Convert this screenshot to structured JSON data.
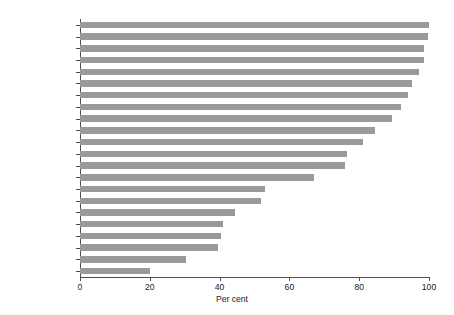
{
  "chart_data": {
    "type": "bar",
    "orientation": "horizontal",
    "title": "",
    "subtitle": "",
    "xlabel": "Per cent",
    "ylabel": "",
    "xlim": [
      0,
      100
    ],
    "xticks": [
      0,
      20,
      40,
      60,
      80,
      100
    ],
    "grid": false,
    "legend": null,
    "bar_color": "#9a9a9a",
    "axis_color": "#4d4d4d",
    "text_color": "#1a1a1a",
    "categories": [
      "Ireland",
      "Sweden",
      "New Zealand",
      "Norway",
      "Finland",
      "Austria",
      "Denmark",
      "Netherlands",
      "Portugal",
      "United States",
      "Luxembourg",
      "Kenya",
      "Poland",
      "UK",
      "Belgium",
      "Germany",
      "France",
      "Brazil",
      "Italy",
      "Canada",
      "Spain",
      "Greece"
    ],
    "values": [
      100,
      99.7,
      98.5,
      98.5,
      97,
      95,
      94,
      92,
      89.5,
      84.5,
      81,
      76.5,
      76,
      67,
      53,
      52,
      44.5,
      41,
      40.5,
      39.5,
      30.5,
      20
    ]
  }
}
